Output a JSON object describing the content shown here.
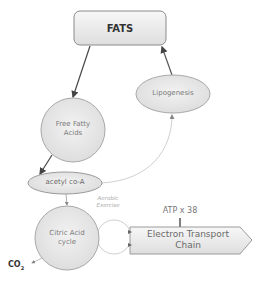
{
  "diagram": {
    "nodes": {
      "fats": {
        "label": "FATS",
        "shape": "rounded-rectangle"
      },
      "free_fatty_acids": {
        "label_line1": "Free Fatty",
        "label_line2": "Acids",
        "shape": "circle"
      },
      "lipogenesis": {
        "label": "Lipogenesis",
        "shape": "ellipse"
      },
      "acetyl_coa": {
        "label": "acetyl co-A",
        "shape": "ellipse"
      },
      "citric_acid_cycle": {
        "label_line1": "Citric Acid",
        "label_line2": "cycle",
        "shape": "circle"
      },
      "electron_transport_chain": {
        "label_line1": "Electron Transport",
        "label_line2": "Chain",
        "shape": "pentagon-arrow"
      }
    },
    "labels": {
      "aerobic_line1": "Aerobic",
      "aerobic_line2": "Exercise",
      "atp": "ATP x 38",
      "co2_main": "CO",
      "co2_sub": "2"
    },
    "edges": [
      {
        "from": "FATS",
        "to": "Free Fatty Acids"
      },
      {
        "from": "Free Fatty Acids",
        "to": "acetyl co-A"
      },
      {
        "from": "acetyl co-A",
        "to": "Lipogenesis"
      },
      {
        "from": "Lipogenesis",
        "to": "FATS"
      },
      {
        "from": "acetyl co-A",
        "to": "Citric Acid cycle"
      },
      {
        "from": "Citric Acid cycle",
        "to": "Electron Transport Chain",
        "label": "Aerobic Exercise"
      },
      {
        "from": "Electron Transport Chain",
        "to": "ATP x 38"
      },
      {
        "from": "Citric Acid cycle",
        "to": "CO2"
      }
    ],
    "colors": {
      "node_fill": "#e8e8e8",
      "node_stroke": "#9a9a9a",
      "dark_arrow": "#444444",
      "light_arrow": "#c8c8c8",
      "text": "#7a7a7a"
    }
  }
}
